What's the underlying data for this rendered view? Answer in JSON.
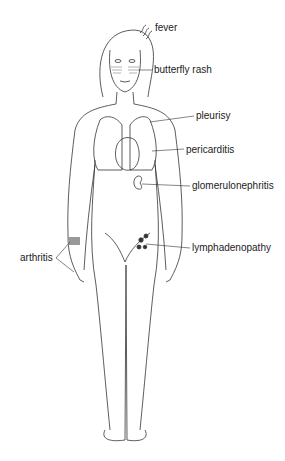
{
  "diagram": {
    "labels": {
      "fever": "fever",
      "butterfly_rash": "butterfly rash",
      "pleurisy": "pleurisy",
      "pericarditis": "pericarditis",
      "glomerulonephritis": "glomerulonephritis",
      "lymphadenopathy": "lymphadenopathy",
      "arthritis": "arthritis"
    },
    "colors": {
      "line": "#333333",
      "background": "#ffffff"
    }
  }
}
